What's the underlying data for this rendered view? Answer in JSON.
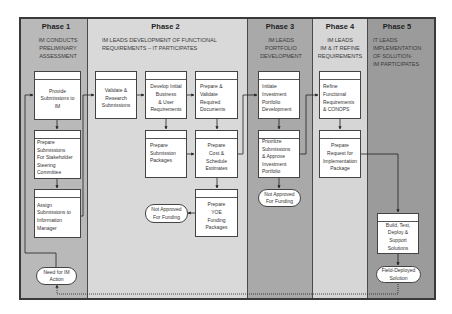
{
  "colors": {
    "phase1_bg": "#b9b9b9",
    "phase2_bg": "#d9d9d9",
    "phase3_bg": "#a9a9a9",
    "phase4_bg": "#d6d6d6",
    "phase5_bg": "#9b9b9b",
    "box_bg": "#ffffff",
    "line": "#222222"
  },
  "phases": [
    {
      "title": "Phase 1",
      "subtitle": "IM CONDUCTS\nPRELIMINARY\nASSESSMENT"
    },
    {
      "title": "Phase 2",
      "subtitle": "IM LEADS DEVELOPMENT OF FUNCTIONAL\nREQUIREMENTS – IT PARTICIPATES"
    },
    {
      "title": "Phase 3",
      "subtitle": "IM LEADS\nPORTFOLIO\nDEVELOPMENT"
    },
    {
      "title": "Phase 4",
      "subtitle": "IM LEADS\nIM & IT REFINE\nREQUIREMENTS"
    },
    {
      "title": "Phase 5",
      "subtitle": "IT LEADS\nIMPLEMENTATION\nOF SOLUTION-\nIM PARTICIPATES"
    }
  ],
  "boxes": {
    "provide": "Provide\nSubmissions to\nIM",
    "prepare_stakeholder": "Prepare\nSubmissions\nFor Stakeholder\nSteering\nCommittee",
    "assign": "Assign\nSubmissions to\nInformation\nManager",
    "validate": "Validate &\nResearch\nSubmissions",
    "develop": "Develop Initial\nBusiness\n& User\nRequirements",
    "prepare_validate": "Prepare &\nValidate\nRequired\nDocuments",
    "prepare_packages": "Prepare\nSubmission\nPackages",
    "prepare_cost": "Prepare\nCost &\nSchedule\nEstimates",
    "prepare_yoe": "Prepare\nYOE\nFunding\nPackages",
    "initiate": "Initiate\nInvestment\nPortfolio\nDevelopment",
    "prioritize": "Prioritize\nSubmissions\n& Approve\nInvestment\nPortfolio",
    "refine": "Refine\nFunctional\nRequirements\n& CONOPS",
    "prepare_request": "Prepare\nRequest for\nImplementation\nPackage",
    "build": "Build, Test,\nDeploy &\nSupport\nSolutions"
  },
  "terminals": {
    "need_im": "Need for IM\nAction",
    "not_approved_p2": "Not Approved\nFor Funding",
    "not_approved_p3": "Not Approved\nFor Funding",
    "field_deployed": "Field-Deployed\nSolution"
  }
}
